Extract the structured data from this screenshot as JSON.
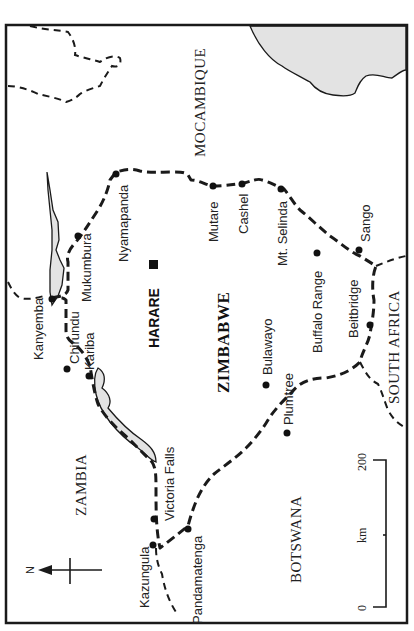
{
  "map": {
    "title_orientation": "rotated -90deg (north points left)",
    "colors": {
      "ink": "#1a1a1a",
      "water": "#e3e3e3",
      "background": "#ffffff"
    },
    "countries": {
      "zimbabwe": "ZIMBABWE",
      "mozambique": "MOCAMBIQUE",
      "zambia": "ZAMBIA",
      "botswana": "BOTSWANA",
      "south_africa": "SOUTH AFRICA"
    },
    "capital": {
      "name": "HARARE",
      "symbol": "square"
    },
    "towns": {
      "kanyemba": "Kanyemba",
      "chirundu": "Chirundu",
      "kariba": "Kariba",
      "mukumbura": "Mukumbura",
      "nyamapanda": "Nyamapanda",
      "mutare": "Mutare",
      "cashel": "Cashel",
      "mt_selinda": "Mt. Selinda",
      "sango": "Sango",
      "buffalo_range": "Buffalo Range",
      "beitbridge": "Beitbridge",
      "bulawayo": "Bulawayo",
      "plumtree": "Plumtree",
      "victoria_falls": "Victoria Falls",
      "kazungula": "Kazungula",
      "pandamatenga": "Pandamatenga"
    },
    "north_arrow": {
      "label": "N",
      "icon": "north-arrow-icon"
    },
    "scale_bar": {
      "start": "0",
      "end": "200",
      "unit": "km"
    }
  }
}
